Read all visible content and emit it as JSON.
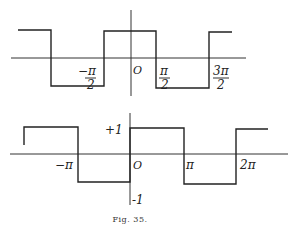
{
  "figure": {
    "caption": "Fig. 35.",
    "top_graph": {
      "description": "Square wave, +1 on (-π/2, π/2), -1 on (π/2, 3π/2), period 2π",
      "labels": {
        "neg_half_pi_num": "−π",
        "neg_half_pi_den": "2",
        "origin": "O",
        "half_pi_num": "π",
        "half_pi_den": "2",
        "three_half_pi_num": "3π",
        "three_half_pi_den": "2"
      },
      "breakpoints": [
        "-3π/2",
        "-π/2",
        "π/2",
        "3π/2"
      ],
      "levels": [
        1,
        -1
      ]
    },
    "bottom_graph": {
      "description": "Square wave, +1 on (0, π), -1 on (-π, 0) and (π, 2π), period 2π",
      "labels": {
        "plus_one": "+1",
        "minus_one": "-1",
        "neg_pi": "−π",
        "origin": "O",
        "pi": "π",
        "two_pi": "2π"
      },
      "breakpoints": [
        "-π",
        "0",
        "π",
        "2π"
      ],
      "levels": [
        1,
        -1
      ]
    }
  }
}
